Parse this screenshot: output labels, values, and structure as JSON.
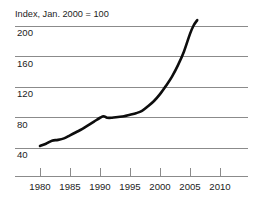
{
  "chart_data": {
    "type": "line",
    "title": "Index, Jan. 2000 = 100",
    "xlabel": "",
    "ylabel": "",
    "xlim": [
      1978.0,
      2012.0
    ],
    "ylim": [
      28,
      212
    ],
    "grid": true,
    "legend_position": "none",
    "yticks": [
      200,
      160,
      120,
      80,
      40
    ],
    "ytick_labels": [
      "200",
      "160",
      "120",
      "80",
      "40"
    ],
    "xticks": [
      1980,
      1985,
      1990,
      1995,
      2000,
      2005,
      2010
    ],
    "xtick_labels": [
      "1980",
      "1985",
      "1990",
      "1995",
      "2000",
      "2005",
      "2010"
    ],
    "series": [
      {
        "name": "Index",
        "x": [
          1980.0,
          1981.0,
          1982.0,
          1983.0,
          1984.0,
          1985.0,
          1986.0,
          1987.0,
          1988.0,
          1989.0,
          1990.0,
          1990.6,
          1991.2,
          1992.0,
          1993.0,
          1994.0,
          1995.0,
          1996.0,
          1997.0,
          1998.0,
          1999.0,
          2000.0,
          2001.0,
          2002.0,
          2003.0,
          2004.0,
          2005.0,
          2005.6,
          2006.2
        ],
        "values": [
          42,
          45,
          49,
          50,
          52,
          56,
          60,
          64,
          69,
          74,
          79,
          81,
          79,
          79,
          80,
          81,
          83,
          85,
          88,
          94,
          101,
          110,
          121,
          133,
          148,
          166,
          189,
          200,
          207
        ]
      }
    ],
    "colors": {
      "line": "#0d0d0d",
      "grid": "#8b8b8b",
      "axis": "#8b8b8b",
      "text": "#1c1c1c",
      "background": "#ffffff"
    },
    "annotations": []
  }
}
